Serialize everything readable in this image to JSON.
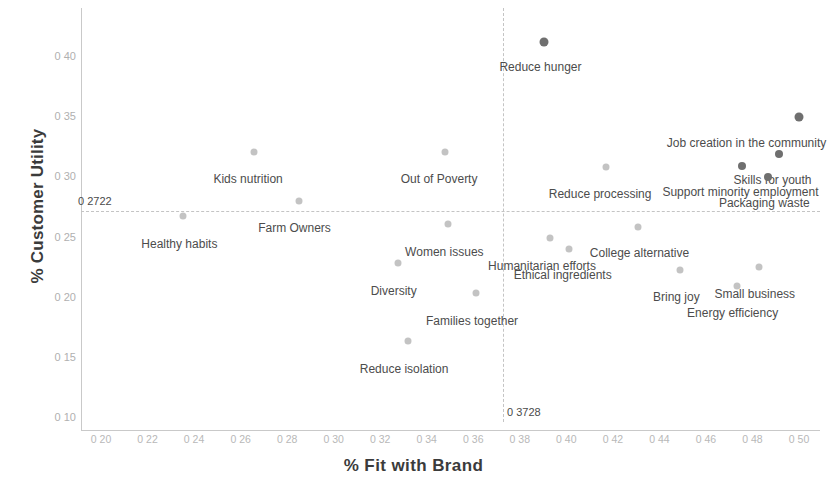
{
  "chart_data": {
    "type": "scatter",
    "title": "",
    "xlabel": "%  Fit with Brand",
    "ylabel": "% Customer Utility",
    "xlim": [
      0.19,
      0.505
    ],
    "ylim": [
      0.095,
      0.425
    ],
    "xticks": [
      "0 20",
      "0 22",
      "0 24",
      "0 26",
      "0 28",
      "0 30",
      "0 32",
      "0 34",
      "0 36",
      "0 38",
      "0 40",
      "0 42",
      "0 44",
      "0 46",
      "0 48",
      "0 50"
    ],
    "xtick_values": [
      0.2,
      0.22,
      0.24,
      0.26,
      0.28,
      0.3,
      0.32,
      0.34,
      0.36,
      0.38,
      0.4,
      0.42,
      0.44,
      0.46,
      0.48,
      0.5
    ],
    "yticks": [
      "0 40",
      "0 35",
      "0 30",
      "0 25",
      "0 20",
      "0 15",
      "0 10"
    ],
    "ytick_values": [
      0.4,
      0.35,
      0.3,
      0.25,
      0.2,
      0.15,
      0.1
    ],
    "grid": false,
    "legend": null,
    "reference_lines": {
      "vertical": {
        "value": 0.3728,
        "label": "0 3728",
        "style": "dashed"
      },
      "horizontal": {
        "value": 0.2722,
        "label": "0 2722",
        "style": "dashed"
      }
    },
    "point_color": "#9e9e9e",
    "point_color_dark": "#6f6f6f",
    "points": [
      {
        "label": "Reduce hunger",
        "x": 0.3906,
        "y": 0.4128,
        "label_dx": -4,
        "label_dy": 18,
        "shade": "dark",
        "size": 9
      },
      {
        "label": "Job creation in the community",
        "x": 0.4998,
        "y": 0.3504,
        "label_dx": -52,
        "label_dy": 19,
        "shade": "dark",
        "size": 9
      },
      {
        "label": "Kids nutrition",
        "x": 0.2658,
        "y": 0.3213,
        "label_dx": -6,
        "label_dy": 20,
        "shade": "light",
        "size": 7
      },
      {
        "label": "Out of Poverty",
        "x": 0.3479,
        "y": 0.3213,
        "label_dx": -6,
        "label_dy": 20,
        "shade": "light",
        "size": 7
      },
      {
        "label": "Skills for youth",
        "x": 0.4912,
        "y": 0.319,
        "label_dx": -6,
        "label_dy": 19,
        "shade": "dark",
        "size": 8
      },
      {
        "label": "Support minority employment",
        "x": 0.4757,
        "y": 0.3092,
        "label_dx": -2,
        "label_dy": 19,
        "shade": "dark",
        "size": 8
      },
      {
        "label": "Packaging waste",
        "x": 0.4868,
        "y": 0.3002,
        "label_dx": -4,
        "label_dy": 19,
        "shade": "dark",
        "size": 8
      },
      {
        "label": "Reduce processing",
        "x": 0.4171,
        "y": 0.3084,
        "label_dx": -6,
        "label_dy": 20,
        "shade": "light",
        "size": 7
      },
      {
        "label": "Farm Owners",
        "x": 0.2849,
        "y": 0.28,
        "label_dx": -4,
        "label_dy": 20,
        "shade": "light",
        "size": 7
      },
      {
        "label": "Healthy habits",
        "x": 0.2354,
        "y": 0.2681,
        "label_dx": -4,
        "label_dy": 21,
        "shade": "light",
        "size": 7
      },
      {
        "label": "Women issues",
        "x": 0.3493,
        "y": 0.2616,
        "label_dx": -4,
        "label_dy": 21,
        "shade": "light",
        "size": 7
      },
      {
        "label": "Humanitarian efforts",
        "x": 0.393,
        "y": 0.2494,
        "label_dx": -8,
        "label_dy": 21,
        "shade": "light",
        "size": 7
      },
      {
        "label": "College alternative",
        "x": 0.4306,
        "y": 0.2584,
        "label_dx": 2,
        "label_dy": 19,
        "shade": "light",
        "size": 7
      },
      {
        "label": "Ethical ingredients",
        "x": 0.401,
        "y": 0.2404,
        "label_dx": -6,
        "label_dy": 19,
        "shade": "light",
        "size": 7
      },
      {
        "label": "Diversity",
        "x": 0.3275,
        "y": 0.229,
        "label_dx": -4,
        "label_dy": 21,
        "shade": "light",
        "size": 7
      },
      {
        "label": "Families together",
        "x": 0.3612,
        "y": 0.2039,
        "label_dx": -4,
        "label_dy": 21,
        "shade": "light",
        "size": 7
      },
      {
        "label": "Reduce isolation",
        "x": 0.332,
        "y": 0.1641,
        "label_dx": -4,
        "label_dy": 21,
        "shade": "light",
        "size": 7
      },
      {
        "label": "Bring joy",
        "x": 0.449,
        "y": 0.223,
        "label_dx": -4,
        "label_dy": 20,
        "shade": "light",
        "size": 7
      },
      {
        "label": "Small business",
        "x": 0.4827,
        "y": 0.2255,
        "label_dx": -4,
        "label_dy": 20,
        "shade": "light",
        "size": 7
      },
      {
        "label": "Energy efficiency",
        "x": 0.4732,
        "y": 0.2097,
        "label_dx": -4,
        "label_dy": 20,
        "shade": "light",
        "size": 7
      }
    ]
  }
}
